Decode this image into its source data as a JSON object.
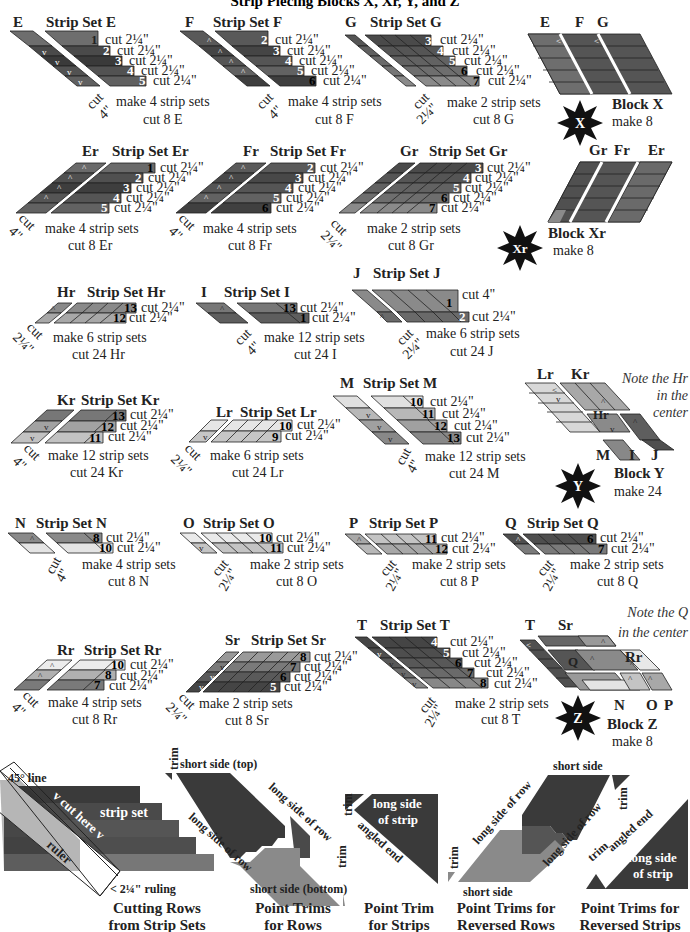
{
  "title": "Strip Piecing Blocks X, Xr, Y, and Z",
  "colors": {
    "darkest": "#2e2e2e",
    "dark": "#464646",
    "mid_dark": "#595959",
    "mid": "#6e6e6e",
    "mid_light": "#8a8a8a",
    "light": "#a8a8a8",
    "lighter": "#c6c6c6",
    "lightest": "#e4e4e4",
    "star": "#111111"
  },
  "strip_sets": {
    "E": {
      "piece": "E",
      "title": "Strip Set E",
      "rows": [
        {
          "n": "1",
          "cut": "cut 2¼\""
        },
        {
          "n": "2",
          "cut": "cut 2¼\""
        },
        {
          "n": "3",
          "cut": "cut 2¼\""
        },
        {
          "n": "4",
          "cut": "cut 2¼\""
        },
        {
          "n": "5",
          "cut": "cut 2¼\""
        }
      ],
      "cut_label": "cut",
      "cut_size": "4\"",
      "make": "make 4 strip sets",
      "cut_count": "cut 8 E"
    },
    "F": {
      "piece": "F",
      "title": "Strip Set F",
      "rows": [
        {
          "n": "2",
          "cut": "cut 2¼\""
        },
        {
          "n": "3",
          "cut": "cut 2¼\""
        },
        {
          "n": "4",
          "cut": "cut 2¼\""
        },
        {
          "n": "5",
          "cut": "cut 2¼\""
        },
        {
          "n": "6",
          "cut": "cut 2¼\""
        }
      ],
      "cut_label": "cut",
      "cut_size": "4\"",
      "make": "make 4 strip sets",
      "cut_count": "cut 8 F"
    },
    "G": {
      "piece": "G",
      "title": "Strip Set G",
      "rows": [
        {
          "n": "3",
          "cut": "cut 2¼\""
        },
        {
          "n": "4",
          "cut": "cut 2¼\""
        },
        {
          "n": "5",
          "cut": "cut 2¼\""
        },
        {
          "n": "6",
          "cut": "cut 2¼\""
        },
        {
          "n": "7",
          "cut": "cut 2¼\""
        }
      ],
      "cut_label": "cut",
      "cut_size": "2¼\"",
      "make": "make 2 strip sets",
      "cut_count": "cut 8 G"
    },
    "Er": {
      "piece": "Er",
      "title": "Strip Set Er",
      "rows": [
        {
          "n": "1",
          "cut": "cut 2¼\""
        },
        {
          "n": "2",
          "cut": "cut 2¼\""
        },
        {
          "n": "3",
          "cut": "cut 2¼\""
        },
        {
          "n": "4",
          "cut": "cut 2¼\""
        },
        {
          "n": "5",
          "cut": "cut 2¼\""
        }
      ],
      "cut_label": "cut",
      "cut_size": "4\"",
      "make": "make 4 strip sets",
      "cut_count": "cut 8 Er"
    },
    "Fr": {
      "piece": "Fr",
      "title": "Strip Set Fr",
      "rows": [
        {
          "n": "2",
          "cut": "cut 2¼\""
        },
        {
          "n": "3",
          "cut": "cut 2¼\""
        },
        {
          "n": "4",
          "cut": "cut 2¼\""
        },
        {
          "n": "5",
          "cut": "cut 2¼\""
        },
        {
          "n": "6",
          "cut": "cut 2¼\""
        }
      ],
      "cut_label": "cut",
      "cut_size": "4\"",
      "make": "make 4 strip sets",
      "cut_count": "cut 8 Fr"
    },
    "Gr": {
      "piece": "Gr",
      "title": "Strip Set Gr",
      "rows": [
        {
          "n": "3",
          "cut": "cut 2¼\""
        },
        {
          "n": "4",
          "cut": "cut 2¼\""
        },
        {
          "n": "5",
          "cut": "cut 2¼\""
        },
        {
          "n": "6",
          "cut": "cut 2¼\""
        },
        {
          "n": "7",
          "cut": "cut 2¼\""
        }
      ],
      "cut_label": "cut",
      "cut_size": "2¼\"",
      "make": "make 2 strip sets",
      "cut_count": "cut 8 Gr"
    },
    "Hr": {
      "piece": "Hr",
      "title": "Strip Set Hr",
      "rows": [
        {
          "n": "13",
          "cut": "cut 2¼\""
        },
        {
          "n": "12",
          "cut": "cut 2¼\""
        }
      ],
      "cut_label": "cut",
      "cut_size": "2¼\"",
      "make": "make 6 strip sets",
      "cut_count": "cut 24 Hr"
    },
    "I": {
      "piece": "I",
      "title": "Strip Set I",
      "rows": [
        {
          "n": "13",
          "cut": "cut 2¼\""
        },
        {
          "n": "1",
          "cut": "cut 2¼\""
        }
      ],
      "cut_label": "cut",
      "cut_size": "4\"",
      "make": "make 12 strip sets",
      "cut_count": "cut 24 I"
    },
    "J": {
      "piece": "J",
      "title": "Strip Set J",
      "rows": [
        {
          "n": "1",
          "cut": "cut 4\""
        },
        {
          "n": "2",
          "cut": "cut 2¼\""
        }
      ],
      "cut_label": "cut",
      "cut_size": "2¼\"",
      "make": "make 6 strip sets",
      "cut_count": "cut 24 J"
    },
    "Kr": {
      "piece": "Kr",
      "title": "Strip Set Kr",
      "rows": [
        {
          "n": "13",
          "cut": "cut 2¼\""
        },
        {
          "n": "12",
          "cut": "cut 2¼\""
        },
        {
          "n": "11",
          "cut": "cut 2¼\""
        }
      ],
      "cut_label": "cut",
      "cut_size": "4\"",
      "make": "make 12 strip sets",
      "cut_count": "cut 24 Kr"
    },
    "Lr": {
      "piece": "Lr",
      "title": "Strip Set Lr",
      "rows": [
        {
          "n": "10",
          "cut": "cut 2¼\""
        },
        {
          "n": "9",
          "cut": "cut 2¼\""
        }
      ],
      "cut_label": "cut",
      "cut_size": "2¼\"",
      "make": "make 6 strip sets",
      "cut_count": "cut 24 Lr"
    },
    "M": {
      "piece": "M",
      "title": "Strip Set M",
      "rows": [
        {
          "n": "10",
          "cut": "cut 2¼\""
        },
        {
          "n": "11",
          "cut": "cut 2¼\""
        },
        {
          "n": "12",
          "cut": "cut 2¼\""
        },
        {
          "n": "13",
          "cut": "cut 2¼\""
        }
      ],
      "cut_label": "cut",
      "cut_size": "4\"",
      "make": "make 12 strip sets",
      "cut_count": "cut 24 M"
    },
    "N": {
      "piece": "N",
      "title": "Strip Set N",
      "rows": [
        {
          "n": "8",
          "cut": "cut 2¼\""
        },
        {
          "n": "10",
          "cut": "cut 2¼\""
        }
      ],
      "cut_label": "cut",
      "cut_size": "4\"",
      "make": "make 4 strip sets",
      "cut_count": "cut 8 N"
    },
    "O": {
      "piece": "O",
      "title": "Strip Set O",
      "rows": [
        {
          "n": "10",
          "cut": "cut 2¼\""
        },
        {
          "n": "11",
          "cut": "cut 2¼\""
        }
      ],
      "cut_label": "cut",
      "cut_size": "2¼\"",
      "make": "make 2 strip sets",
      "cut_count": "cut 8 O"
    },
    "P": {
      "piece": "P",
      "title": "Strip Set P",
      "rows": [
        {
          "n": "11",
          "cut": "cut 2¼\""
        },
        {
          "n": "12",
          "cut": "cut 2¼\""
        }
      ],
      "cut_label": "cut",
      "cut_size": "2¼\"",
      "make": "make 2 strip sets",
      "cut_count": "cut 8 P"
    },
    "Q": {
      "piece": "Q",
      "title": "Strip Set Q",
      "rows": [
        {
          "n": "6",
          "cut": "cut 2¼\""
        },
        {
          "n": "7",
          "cut": "cut 2¼\""
        }
      ],
      "cut_label": "cut",
      "cut_size": "2¼\"",
      "make": "make 2 strip sets",
      "cut_count": "cut 8 Q"
    },
    "Rr": {
      "piece": "Rr",
      "title": "Strip Set Rr",
      "rows": [
        {
          "n": "10",
          "cut": "cut 2¼\""
        },
        {
          "n": "8",
          "cut": "cut 2¼\""
        },
        {
          "n": "7",
          "cut": "cut 2¼\""
        }
      ],
      "cut_label": "cut",
      "cut_size": "4\"",
      "make": "make 4 strip sets",
      "cut_count": "cut 8 Rr"
    },
    "Sr": {
      "piece": "Sr",
      "title": "Strip Set Sr",
      "rows": [
        {
          "n": "8",
          "cut": "cut 2¼\""
        },
        {
          "n": "7",
          "cut": "cut 2¼\""
        },
        {
          "n": "6",
          "cut": "cut 2¼\""
        },
        {
          "n": "5",
          "cut": "cut 2¼\""
        }
      ],
      "cut_label": "cut",
      "cut_size": "2¼\"",
      "make": "make 2 strip sets",
      "cut_count": "cut 8 Sr"
    },
    "T": {
      "piece": "T",
      "title": "Strip Set T",
      "rows": [
        {
          "n": "4",
          "cut": "cut 2¼\""
        },
        {
          "n": "5",
          "cut": "cut 2¼\""
        },
        {
          "n": "6",
          "cut": "cut 2¼\""
        },
        {
          "n": "7",
          "cut": "cut 2¼\""
        },
        {
          "n": "8",
          "cut": "cut 2¼\""
        }
      ],
      "cut_label": "cut",
      "cut_size": "2¼\"",
      "make": "make 2 strip sets",
      "cut_count": "cut 8 T"
    }
  },
  "blocks": {
    "X": {
      "star": "X",
      "title": "Block X",
      "make": "make 8",
      "parts": [
        "E",
        "F",
        "G"
      ]
    },
    "Xr": {
      "star": "Xr",
      "title": "Block Xr",
      "make": "make 8",
      "parts": [
        "Gr",
        "Fr",
        "Er"
      ]
    },
    "Y": {
      "star": "Y",
      "title": "Block Y",
      "make": "make 24",
      "parts_top": [
        "Lr",
        "Kr"
      ],
      "parts_bottom": [
        "M",
        "I",
        "J"
      ],
      "center": "Hr",
      "note": [
        "Note the Hr",
        "in the",
        "center"
      ]
    },
    "Z": {
      "star": "Z",
      "title": "Block Z",
      "make": "make 8",
      "parts_top": [
        "T",
        "Sr"
      ],
      "parts_right": "Rr",
      "parts_bottom": [
        "N",
        "O",
        "P"
      ],
      "center": "Q",
      "note": [
        "Note the Q",
        "in the center"
      ]
    }
  },
  "instructions": {
    "cutting": {
      "line45": "45° line",
      "cut_here": "v cut here v",
      "strip_set": "strip set",
      "ruler": "ruler",
      "ruling": "< 2¼\" ruling",
      "caption": [
        "Cutting Rows",
        "from Strip Sets"
      ]
    },
    "rows": {
      "trim": "trim",
      "short_top": "short side (top)",
      "long1": "long side of row",
      "long2": "long side of row",
      "trim2": "trim",
      "short_bottom": "short side (bottom)",
      "caption": [
        "Point Trims",
        "for Rows"
      ]
    },
    "strips": {
      "trim": "trim",
      "long_side": [
        "long side",
        "of strip"
      ],
      "angled": "angled end",
      "caption": [
        "Point Trim",
        "for Strips"
      ]
    },
    "rev_rows": {
      "short_top": "short side",
      "long1": "long side of row",
      "long2": "long side of row",
      "trim1": "trim",
      "trim2": "trim",
      "short_bottom": "short side",
      "caption": [
        "Point Trims for",
        "Reversed Rows"
      ]
    },
    "rev_strips": {
      "trim": "trim",
      "angled": "angled end",
      "long_side": [
        "long side",
        "of strip"
      ],
      "caption": [
        "Point Trims for",
        "Reversed Strips"
      ]
    }
  }
}
